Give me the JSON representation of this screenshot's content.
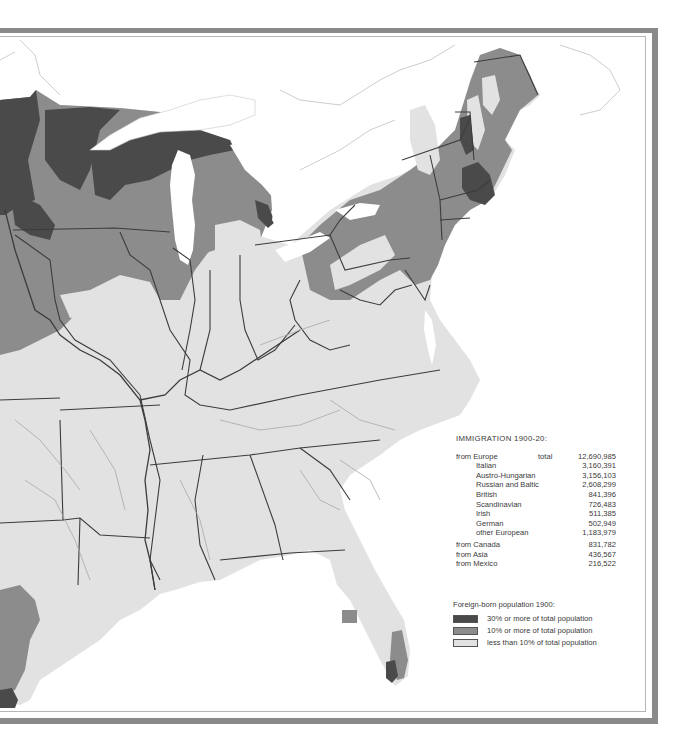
{
  "stats": {
    "title": "IMMIGRATION 1900-20:",
    "europe": {
      "label": "from Europe",
      "total_label": "total",
      "total_value": "12,690,985",
      "breakdown": [
        {
          "label": "Italian",
          "value": "3,160,391"
        },
        {
          "label": "Austro-Hungarian",
          "value": "3,156,103"
        },
        {
          "label": "Russian and Baltic",
          "value": "2,608,299"
        },
        {
          "label": "British",
          "value": "841,396"
        },
        {
          "label": "Scandinavian",
          "value": "726,483"
        },
        {
          "label": "Irish",
          "value": "511,385"
        },
        {
          "label": "German",
          "value": "502,949"
        },
        {
          "label": "other European",
          "value": "1,183,979"
        }
      ]
    },
    "other_sources": [
      {
        "label": "from Canada",
        "value": "831,782"
      },
      {
        "label": "from Asia",
        "value": "436,567"
      },
      {
        "label": "from Mexico",
        "value": "216,522"
      }
    ]
  },
  "legend": {
    "title": "Foreign-born population 1900:",
    "items": [
      {
        "label": "30% or more of total population",
        "color": "#4a4a4a"
      },
      {
        "label": "10% or more of total population",
        "color": "#8c8c8c"
      },
      {
        "label": "less than 10% of total population",
        "color": "#e2e2e2"
      }
    ]
  },
  "colors": {
    "high": "#4a4a4a",
    "medium": "#8c8c8c",
    "low": "#e2e2e2",
    "water": "#ffffff",
    "border": "#3c3c3c",
    "river": "#a8a8a8",
    "frame": "#8a8a8a"
  }
}
